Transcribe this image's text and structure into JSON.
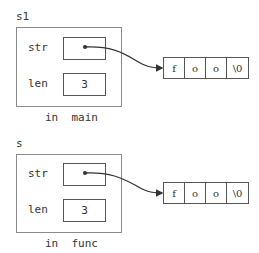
{
  "frames": [
    {
      "name": "s1",
      "caption": "in  main",
      "fields": [
        {
          "label": "str",
          "value": ""
        },
        {
          "label": "len",
          "value": "3"
        }
      ],
      "array": [
        "f",
        "o",
        "o",
        "\\0"
      ]
    },
    {
      "name": "s",
      "caption": "in  func",
      "fields": [
        {
          "label": "str",
          "value": ""
        },
        {
          "label": "len",
          "value": "3"
        }
      ],
      "array": [
        "f",
        "o",
        "o",
        "\\0"
      ]
    }
  ],
  "colors": {
    "line": "#333333",
    "frame_border": "#8a8a8a"
  }
}
